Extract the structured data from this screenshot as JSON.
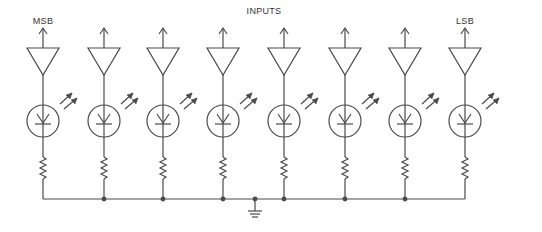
{
  "title": "INPUTS",
  "labels": {
    "msb": "MSB",
    "lsb": "LSB"
  },
  "channels": [
    {
      "index": 0,
      "x": 43,
      "label": "MSB"
    },
    {
      "index": 1,
      "x": 104,
      "label": ""
    },
    {
      "index": 2,
      "x": 163,
      "label": ""
    },
    {
      "index": 3,
      "x": 223,
      "label": ""
    },
    {
      "index": 4,
      "x": 284,
      "label": ""
    },
    {
      "index": 5,
      "x": 345,
      "label": ""
    },
    {
      "index": 6,
      "x": 405,
      "label": ""
    },
    {
      "index": 7,
      "x": 465,
      "label": "LSB"
    }
  ],
  "components_per_channel": [
    "output-arrow",
    "buffer-amplifier",
    "photodiode",
    "light-arrows",
    "resistor"
  ],
  "bus": {
    "y": 199,
    "ground_x": 255
  },
  "colors": {
    "line": "#4a4a4a",
    "text": "#333333",
    "background": "#ffffff"
  }
}
